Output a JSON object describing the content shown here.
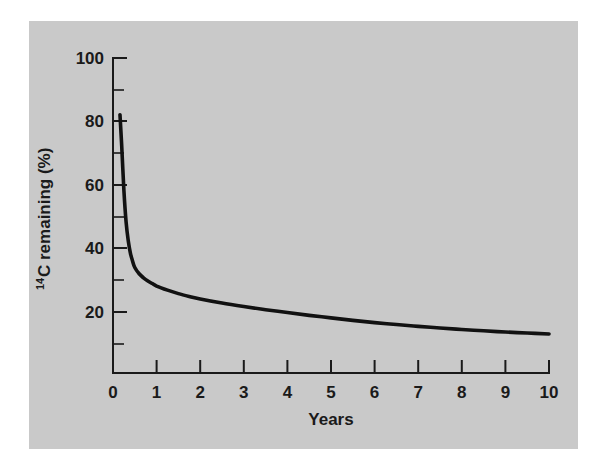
{
  "figure": {
    "background_color": "#c9c9c9",
    "page_color": "#ffffff",
    "ink_color": "#111111"
  },
  "chart_data": {
    "type": "line",
    "title": "",
    "subtitle": "",
    "xlabel": "Years",
    "ylabel_prefix": "14",
    "ylabel": "C remaining (%)",
    "ylabel_full": "14C remaining (%)",
    "xlim": [
      0,
      10
    ],
    "ylim": [
      0,
      100
    ],
    "grid": false,
    "legend": false,
    "legend_position": "none",
    "x_ticks_major": [
      0,
      1,
      2,
      3,
      4,
      5,
      6,
      7,
      8,
      9,
      10
    ],
    "x_tick_labels": [
      "0",
      "1",
      "2",
      "3",
      "4",
      "5",
      "6",
      "7",
      "8",
      "9",
      "10"
    ],
    "y_ticks_major": [
      20,
      40,
      60,
      80,
      100
    ],
    "y_tick_labels": [
      "20",
      "40",
      "60",
      "80",
      "100"
    ],
    "y_ticks_minor": [
      10,
      30,
      50,
      70,
      90
    ],
    "series": [
      {
        "name": "14C remaining",
        "x": [
          0.16,
          0.2,
          0.25,
          0.3,
          0.35,
          0.4,
          0.45,
          0.5,
          0.6,
          0.7,
          0.8,
          0.9,
          1.0,
          1.25,
          1.5,
          1.75,
          2.0,
          2.5,
          3.0,
          3.5,
          4.0,
          4.5,
          5.0,
          5.5,
          6.0,
          6.5,
          7.0,
          7.5,
          8.0,
          8.5,
          9.0,
          9.5,
          10.0
        ],
        "values": [
          82.0,
          72.0,
          58.0,
          48.0,
          42.0,
          38.0,
          35.5,
          33.5,
          31.5,
          30.2,
          29.2,
          28.4,
          27.6,
          26.3,
          25.2,
          24.3,
          23.5,
          22.2,
          21.1,
          20.1,
          19.2,
          18.3,
          17.5,
          16.7,
          16.0,
          15.4,
          14.8,
          14.3,
          13.8,
          13.4,
          13.0,
          12.7,
          12.4
        ]
      }
    ]
  }
}
